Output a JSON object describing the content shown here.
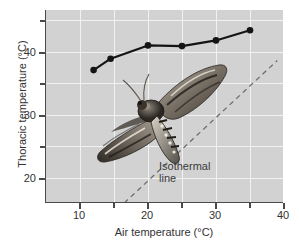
{
  "chart_data": {
    "type": "line",
    "title": "",
    "xlabel": "Air temperature (°C)",
    "ylabel": "Thoracic temperature (°C)",
    "xlim": [
      5,
      40
    ],
    "ylim": [
      16.5,
      47
    ],
    "xticks": [
      10,
      20,
      30,
      40
    ],
    "xticklabels": [
      "10",
      "20",
      "30",
      "40"
    ],
    "xminorticks": [
      15,
      25,
      35
    ],
    "yticks": [
      20,
      30,
      40
    ],
    "yticklabels": [
      "20",
      "30",
      "40"
    ],
    "yminorticks": [
      25,
      35,
      45
    ],
    "grid": true,
    "grid_color": "#f2f2f2",
    "plot_background": "#d2d2d2",
    "legend": "none",
    "series": [
      {
        "name": "Thoracic temperature",
        "marker": "filled-circle",
        "color": "#141414",
        "x": [
          12.0,
          14.5,
          20.0,
          25.0,
          30.0,
          35.0
        ],
        "y": [
          37.5,
          39.3,
          41.4,
          41.3,
          42.2,
          43.8
        ]
      }
    ],
    "reference_line": {
      "name": "Isothermal line",
      "style": "dashed",
      "color": "#6e6e6e",
      "x": [
        16.5,
        39.0
      ],
      "y": [
        16.5,
        39.0
      ]
    },
    "annotations": [
      {
        "name": "isothermal-line-label",
        "line1": "Isothermal",
        "line2": "line"
      }
    ],
    "image_overlay": {
      "name": "moth-photograph",
      "description": "hawkmoth"
    }
  },
  "axes": {
    "x_title": "Air temperature (°C)",
    "y_title": "Thoracic temperature (°C)"
  },
  "annotation": {
    "iso_line1": "Isothermal",
    "iso_line2": "line"
  }
}
